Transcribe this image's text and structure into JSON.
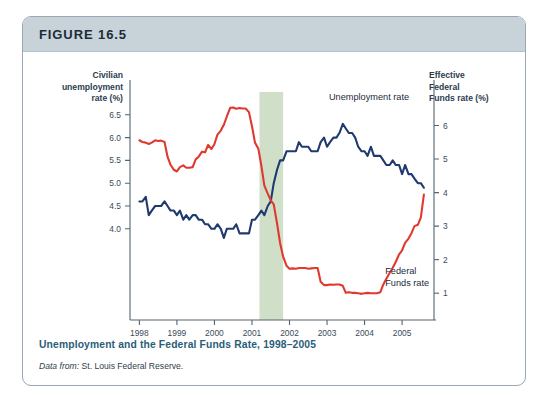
{
  "figure": {
    "header_label": "FIGURE 16.5",
    "caption": "Unemployment and the Federal Funds Rate, 1998–2005",
    "source_prefix": "Data from:",
    "source_rest": " St. Louis Federal Reserve."
  },
  "colors": {
    "header_bar": "#c7d3d9",
    "card_border": "#9aa7b4",
    "caption_text": "#2a5d78",
    "unemployment_line": "#1f3a6e",
    "fed_funds_line": "#e03a30",
    "recession_band": "#cfdfc8",
    "axis": "#55646f"
  },
  "chart_data": {
    "type": "line",
    "title": "Unemployment and the Federal Funds Rate, 1998–2005",
    "xlabel": "Year",
    "x_tick_labels": [
      "1998",
      "1999",
      "2000",
      "2001",
      "2002",
      "2003",
      "2004",
      "2005"
    ],
    "x_tick_values": [
      1998,
      1999,
      2000,
      2001,
      2002,
      2003,
      2004,
      2005
    ],
    "xlim": [
      1997.75,
      2005.85
    ],
    "grid": false,
    "legend_position": "inline-annotation",
    "left_axis": {
      "label": "Civilian\nunemployment\nrate (%)",
      "tick_labels": [
        "6.5",
        "6.0",
        "5.5",
        "5.0",
        "4.5",
        "4.0"
      ],
      "tick_values": [
        6.5,
        6.0,
        5.5,
        5.0,
        4.5,
        4.0
      ],
      "ylim": [
        2.0,
        7.0
      ]
    },
    "right_axis": {
      "label": "Effective\nFederal\nFunds rate (%)",
      "tick_labels": [
        "6",
        "5",
        "4",
        "3",
        "2",
        "1"
      ],
      "tick_values": [
        6,
        5,
        4,
        3,
        2,
        1
      ],
      "ylim": [
        0.2,
        7.0
      ]
    },
    "annotations": [
      {
        "text": "Unemployment rate",
        "x": 2003.05,
        "axis": "left"
      },
      {
        "text": "Federal\nFunds rate",
        "x": 2004.55,
        "axis": "right"
      }
    ],
    "shaded_regions": [
      {
        "name": "recession-band",
        "x_start": 2001.2,
        "x_end": 2001.83,
        "color": "#cfdfc8"
      }
    ],
    "series": [
      {
        "name": "Unemployment rate",
        "axis": "left",
        "color": "#1f3a6e",
        "x": [
          1998.0,
          1998.08,
          1998.17,
          1998.25,
          1998.33,
          1998.42,
          1998.5,
          1998.58,
          1998.67,
          1998.75,
          1998.83,
          1998.92,
          1999.0,
          1999.08,
          1999.17,
          1999.25,
          1999.33,
          1999.42,
          1999.5,
          1999.58,
          1999.67,
          1999.75,
          1999.83,
          1999.92,
          2000.0,
          2000.08,
          2000.17,
          2000.25,
          2000.33,
          2000.42,
          2000.5,
          2000.58,
          2000.67,
          2000.75,
          2000.83,
          2000.92,
          2001.0,
          2001.08,
          2001.17,
          2001.25,
          2001.33,
          2001.42,
          2001.5,
          2001.58,
          2001.67,
          2001.75,
          2001.83,
          2001.92,
          2002.0,
          2002.08,
          2002.17,
          2002.25,
          2002.33,
          2002.42,
          2002.5,
          2002.58,
          2002.67,
          2002.75,
          2002.83,
          2002.92,
          2003.0,
          2003.08,
          2003.17,
          2003.25,
          2003.33,
          2003.42,
          2003.5,
          2003.58,
          2003.67,
          2003.75,
          2003.83,
          2003.92,
          2004.0,
          2004.08,
          2004.17,
          2004.25,
          2004.33,
          2004.42,
          2004.5,
          2004.58,
          2004.67,
          2004.75,
          2004.83,
          2004.92,
          2005.0,
          2005.08,
          2005.17,
          2005.25,
          2005.33,
          2005.42,
          2005.5,
          2005.58
        ],
        "y": [
          4.6,
          4.6,
          4.7,
          4.3,
          4.4,
          4.5,
          4.5,
          4.5,
          4.6,
          4.5,
          4.4,
          4.4,
          4.3,
          4.4,
          4.2,
          4.3,
          4.2,
          4.3,
          4.3,
          4.2,
          4.2,
          4.1,
          4.1,
          4.0,
          4.0,
          4.1,
          4.0,
          3.8,
          4.0,
          4.0,
          4.0,
          4.1,
          3.9,
          3.9,
          3.9,
          3.9,
          4.2,
          4.2,
          4.3,
          4.4,
          4.3,
          4.5,
          4.6,
          5.0,
          5.3,
          5.5,
          5.5,
          5.7,
          5.7,
          5.7,
          5.7,
          5.9,
          5.8,
          5.8,
          5.8,
          5.7,
          5.7,
          5.7,
          5.9,
          6.0,
          5.8,
          5.9,
          6.0,
          6.0,
          6.1,
          6.3,
          6.2,
          6.1,
          6.1,
          6.0,
          5.8,
          5.7,
          5.7,
          5.6,
          5.8,
          5.6,
          5.6,
          5.6,
          5.5,
          5.4,
          5.4,
          5.5,
          5.4,
          5.4,
          5.2,
          5.4,
          5.2,
          5.2,
          5.1,
          5.0,
          5.0,
          4.9
        ]
      },
      {
        "name": "Federal Funds rate",
        "axis": "right",
        "color": "#e03a30",
        "x": [
          1998.0,
          1998.08,
          1998.17,
          1998.25,
          1998.33,
          1998.42,
          1998.5,
          1998.58,
          1998.67,
          1998.75,
          1998.83,
          1998.92,
          1999.0,
          1999.08,
          1999.17,
          1999.25,
          1999.33,
          1999.42,
          1999.5,
          1999.58,
          1999.67,
          1999.75,
          1999.83,
          1999.92,
          2000.0,
          2000.08,
          2000.17,
          2000.25,
          2000.33,
          2000.42,
          2000.5,
          2000.58,
          2000.67,
          2000.75,
          2000.83,
          2000.92,
          2001.0,
          2001.08,
          2001.17,
          2001.25,
          2001.33,
          2001.42,
          2001.5,
          2001.58,
          2001.67,
          2001.75,
          2001.83,
          2001.92,
          2002.0,
          2002.08,
          2002.17,
          2002.25,
          2002.33,
          2002.42,
          2002.5,
          2002.58,
          2002.67,
          2002.75,
          2002.83,
          2002.92,
          2003.0,
          2003.08,
          2003.17,
          2003.25,
          2003.33,
          2003.42,
          2003.5,
          2003.58,
          2003.67,
          2003.75,
          2003.83,
          2003.92,
          2004.0,
          2004.08,
          2004.17,
          2004.25,
          2004.33,
          2004.42,
          2004.5,
          2004.58,
          2004.67,
          2004.75,
          2004.83,
          2004.92,
          2005.0,
          2005.08,
          2005.17,
          2005.25,
          2005.33,
          2005.42,
          2005.5,
          2005.58
        ],
        "y": [
          5.56,
          5.51,
          5.49,
          5.45,
          5.49,
          5.56,
          5.54,
          5.55,
          5.51,
          5.07,
          4.83,
          4.68,
          4.63,
          4.76,
          4.81,
          4.74,
          4.74,
          4.76,
          4.99,
          5.07,
          5.22,
          5.2,
          5.42,
          5.3,
          5.45,
          5.73,
          5.85,
          6.02,
          6.27,
          6.53,
          6.54,
          6.5,
          6.52,
          6.51,
          6.51,
          6.4,
          5.98,
          5.49,
          5.31,
          4.8,
          4.21,
          3.97,
          3.77,
          3.65,
          3.07,
          2.49,
          2.09,
          1.82,
          1.73,
          1.74,
          1.73,
          1.75,
          1.75,
          1.75,
          1.73,
          1.74,
          1.75,
          1.75,
          1.34,
          1.24,
          1.24,
          1.26,
          1.25,
          1.26,
          1.26,
          1.22,
          1.01,
          1.03,
          1.01,
          1.01,
          1.0,
          0.98,
          1.0,
          1.01,
          1.0,
          1.0,
          1.0,
          1.03,
          1.26,
          1.43,
          1.61,
          1.76,
          1.93,
          2.16,
          2.28,
          2.5,
          2.63,
          2.79,
          3.0,
          3.04,
          3.26,
          3.94
        ]
      }
    ]
  }
}
